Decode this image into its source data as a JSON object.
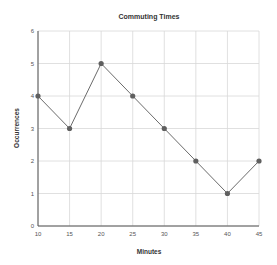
{
  "chart_data": {
    "type": "line",
    "title": "Commuting Times",
    "xlabel": "Minutes",
    "ylabel": "Occurrences",
    "x": [
      10,
      15,
      20,
      25,
      30,
      35,
      40,
      45
    ],
    "categories": [
      "10",
      "15",
      "20",
      "25",
      "30",
      "35",
      "40",
      "45"
    ],
    "series": [
      {
        "name": "Occurrences",
        "values": [
          4,
          3,
          5,
          4,
          3,
          2,
          1,
          2
        ]
      }
    ],
    "xlim": [
      10,
      45
    ],
    "ylim": [
      0,
      6
    ],
    "yticks": [
      0,
      1,
      2,
      3,
      4,
      5,
      6
    ],
    "grid": true,
    "legend": "none",
    "colors": {
      "line": "#6b6b6b",
      "marker": "#5f5f5f",
      "grid": "#d8d8d8",
      "axis": "#555555"
    }
  }
}
